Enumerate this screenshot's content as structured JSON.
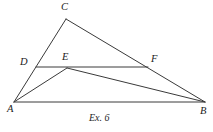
{
  "figure": {
    "caption": "Ex. 6",
    "stroke_color": "#3a3a3a",
    "stroke_color_dark": "#262626",
    "background_color": "#ffffff",
    "label_color": "#1b1b1b",
    "labels": {
      "A": "A",
      "B": "B",
      "C": "C",
      "D": "D",
      "E": "E",
      "F": "F"
    },
    "points": {
      "A": {
        "x": 14,
        "y": 102
      },
      "B": {
        "x": 205,
        "y": 102
      },
      "C": {
        "x": 66,
        "y": 19
      },
      "D": {
        "x": 36,
        "y": 67
      },
      "E": {
        "x": 67,
        "y": 68
      },
      "F": {
        "x": 148,
        "y": 67
      }
    },
    "segments": [
      {
        "name": "segment-AC",
        "from": "A",
        "to": "C"
      },
      {
        "name": "segment-CB",
        "from": "C",
        "to": "B"
      },
      {
        "name": "segment-AB",
        "from": "A",
        "to": "B"
      },
      {
        "name": "segment-DF",
        "from": "D",
        "to": "F"
      },
      {
        "name": "segment-AE",
        "from": "A",
        "to": "E"
      },
      {
        "name": "segment-EB",
        "from": "E",
        "to": "B"
      }
    ]
  }
}
